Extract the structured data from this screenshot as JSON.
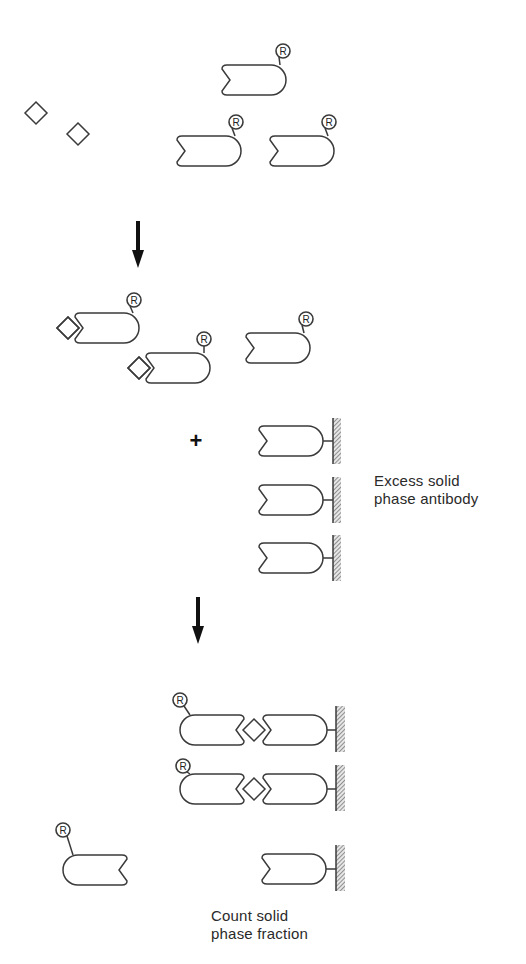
{
  "diagram": {
    "type": "immunoradiometric-assay-schematic",
    "stroke_color": "#3a3a3a",
    "arrow_color": "#111111",
    "label_symbol": "R",
    "stages": [
      {
        "name": "initial-mixture",
        "antigens": [
          {
            "cx": 36,
            "cy": 113
          },
          {
            "cx": 78,
            "cy": 134
          }
        ],
        "labeled_antibodies": [
          {
            "x": 222,
            "y": 65,
            "facing": "left",
            "label_x": 283,
            "label_y": 51
          },
          {
            "x": 177,
            "y": 136,
            "facing": "left",
            "label_x": 236,
            "label_y": 122
          },
          {
            "x": 270,
            "y": 136,
            "facing": "left",
            "label_x": 329,
            "label_y": 122
          }
        ]
      },
      {
        "name": "antigen-bound-labeled-antibodies",
        "complexes": [
          {
            "x": 75,
            "y": 313,
            "antigen_cx": 68,
            "antigen_cy": 328,
            "label_x": 134,
            "label_y": 300
          },
          {
            "x": 146,
            "y": 353,
            "antigen_cx": 139,
            "antigen_cy": 368,
            "label_x": 204,
            "label_y": 339
          }
        ],
        "free_labeled_antibodies": [
          {
            "x": 246,
            "y": 333,
            "facing": "left",
            "label_x": 306,
            "label_y": 319
          }
        ]
      },
      {
        "name": "solid-phase-addition",
        "plus": {
          "symbol": "+",
          "x": 196,
          "y": 441
        },
        "solid_phase_antibodies": [
          {
            "x": 259,
            "y": 426
          },
          {
            "x": 259,
            "y": 485
          },
          {
            "x": 259,
            "y": 543
          }
        ],
        "caption": [
          "Excess solid",
          "phase antibody"
        ]
      },
      {
        "name": "separation-result",
        "sandwiches": [
          {
            "y": 715,
            "label_x": 180,
            "label_y": 700
          },
          {
            "y": 774,
            "label_x": 183,
            "label_y": 766
          }
        ],
        "free_labeled_antibody": {
          "x": 63,
          "y": 855,
          "facing": "right",
          "label_x": 63,
          "label_y": 830
        },
        "unbound_solid_phase_antibody": {
          "x": 262,
          "y": 854
        },
        "caption": [
          "Count solid",
          "phase fraction"
        ]
      }
    ],
    "arrows": [
      {
        "x": 138,
        "y1": 221,
        "y2": 268
      },
      {
        "x": 198,
        "y1": 597,
        "y2": 644
      }
    ]
  },
  "captions": {
    "excess_line1": "Excess solid",
    "excess_line2": "phase antibody",
    "count_line1": "Count solid",
    "count_line2": "phase fraction"
  }
}
